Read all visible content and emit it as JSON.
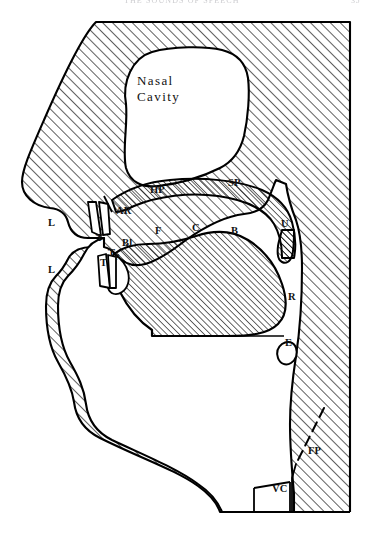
{
  "page": {
    "running_head": "THE SOUNDS OF SPEECH",
    "folio": "35",
    "background_color": "#ffffff",
    "ink_color": "#000000"
  },
  "figure": {
    "name": "sagittal-vocal-tract",
    "cavity_label_line1": "Nasal",
    "cavity_label_line2": "Cavity",
    "hatch_color": "#000000",
    "tissue_fill": "#ffffff"
  },
  "labels": [
    {
      "id": "lips-upper",
      "text": "L",
      "x": 48,
      "y": 218,
      "size": "normal"
    },
    {
      "id": "lips-lower",
      "text": "L",
      "x": 48,
      "y": 265,
      "size": "normal"
    },
    {
      "id": "teeth-upper",
      "text": "T",
      "x": 96,
      "y": 233,
      "size": "normal"
    },
    {
      "id": "teeth-lower",
      "text": "T",
      "x": 100,
      "y": 258,
      "size": "normal"
    },
    {
      "id": "tooth-point",
      "text": "Tp",
      "x": 108,
      "y": 248,
      "size": "normal"
    },
    {
      "id": "alveolar-ridge",
      "text": "AR",
      "x": 116,
      "y": 206,
      "size": "normal"
    },
    {
      "id": "hard-palate",
      "text": "HP",
      "x": 150,
      "y": 185,
      "size": "normal"
    },
    {
      "id": "soft-palate",
      "text": "SP",
      "x": 228,
      "y": 178,
      "size": "normal"
    },
    {
      "id": "uvula",
      "text": "U",
      "x": 281,
      "y": 219,
      "size": "normal"
    },
    {
      "id": "tongue-blade",
      "text": "Bl",
      "x": 122,
      "y": 238,
      "size": "normal"
    },
    {
      "id": "tongue-front",
      "text": "F",
      "x": 155,
      "y": 226,
      "size": "normal"
    },
    {
      "id": "tongue-centre",
      "text": "C",
      "x": 192,
      "y": 223,
      "size": "normal"
    },
    {
      "id": "tongue-back",
      "text": "B",
      "x": 231,
      "y": 226,
      "size": "normal"
    },
    {
      "id": "tongue-root",
      "text": "R",
      "x": 288,
      "y": 292,
      "size": "normal"
    },
    {
      "id": "epiglottis",
      "text": "E",
      "x": 285,
      "y": 338,
      "size": "normal"
    },
    {
      "id": "false-pharynx",
      "text": "FP",
      "x": 308,
      "y": 446,
      "size": "normal"
    },
    {
      "id": "vocal-cords",
      "text": "VC",
      "x": 272,
      "y": 484,
      "size": "normal"
    }
  ],
  "legend_meanings": {
    "L": "lips",
    "T": "teeth",
    "Tp": "tooth point",
    "AR": "alveolar ridge",
    "HP": "hard palate",
    "SP": "soft palate",
    "U": "uvula",
    "Bl": "blade of tongue",
    "F": "front of tongue",
    "C": "centre of tongue",
    "B": "back of tongue",
    "R": "root of tongue",
    "E": "epiglottis",
    "FP": "food passage",
    "VC": "vocal cords"
  }
}
